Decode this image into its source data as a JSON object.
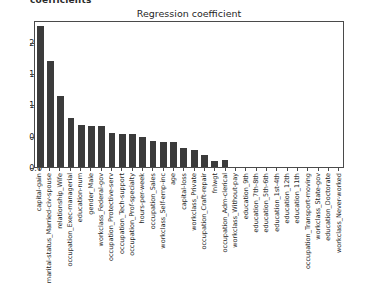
{
  "header_fragment": "coefficients",
  "chart_data": {
    "type": "bar",
    "title": "Regression coefficient",
    "xlabel": "",
    "ylabel": "",
    "ylim": [
      0.0,
      2.35
    ],
    "grid": false,
    "legend": null,
    "bar_color": "#3b3b3b",
    "ytick_labels": [
      "0.0",
      "0.5",
      "1.0",
      "1.5",
      "2.0"
    ],
    "ytick_values": [
      0.0,
      0.5,
      1.0,
      1.5,
      2.0
    ],
    "categories": [
      "capital-gain",
      "marital-status_Married-civ-spouse",
      "relationship_Wife",
      "occupation_Exec-managerial",
      "education-num",
      "gender_Male",
      "workclass_Federal-gov",
      "occupation_Protective-serv",
      "occupation_Tech-support",
      "occupation_Prof-specialty",
      "hours-per-week",
      "occupation_Sales",
      "workclass_Self-emp-inc",
      "age",
      "capital-loss",
      "workclass_Private",
      "occupation_Craft-repair",
      "fnlwgt",
      "occupation_Adm-clerical",
      "workclass_Without-pay",
      "education_9th",
      "education_7th-8th",
      "education_5th-6th",
      "education_1st-4th",
      "education_12th",
      "education_11th",
      "occupation_Transport-moving",
      "workclass_State-gov",
      "education_Doctorate",
      "workclass_Never-worked"
    ],
    "values": [
      2.29,
      1.72,
      1.15,
      0.79,
      0.68,
      0.66,
      0.66,
      0.55,
      0.54,
      0.54,
      0.49,
      0.42,
      0.41,
      0.4,
      0.31,
      0.27,
      0.2,
      0.09,
      0.11,
      0.0,
      0.0,
      0.0,
      0.0,
      0.0,
      0.0,
      0.0,
      0.0,
      0.0,
      0.0,
      0.0
    ]
  }
}
